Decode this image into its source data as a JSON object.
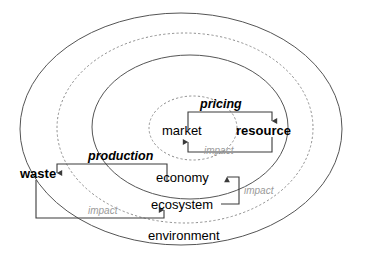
{
  "diagram": {
    "colors": {
      "line": "#555555",
      "dashed": "#8d8d8d",
      "connector": "#3a3a3a",
      "text": "#000000",
      "impact_text": "#9a9a9a",
      "background": "#ffffff"
    },
    "rings": [
      {
        "id": "ring-environment",
        "label": "environment",
        "style": "solid",
        "order": 1
      },
      {
        "id": "ring-dashed-outer",
        "label": "",
        "style": "dashed",
        "order": 2
      },
      {
        "id": "ring-ecosystem-economy",
        "label": "",
        "style": "solid",
        "order": 3
      },
      {
        "id": "ring-dashed-inner",
        "label": "",
        "style": "dashed",
        "order": 4
      }
    ],
    "nodes": [
      {
        "id": "market",
        "label": "market",
        "weight": "regular"
      },
      {
        "id": "resource",
        "label": "resource",
        "weight": "bold"
      },
      {
        "id": "economy",
        "label": "economy",
        "weight": "regular"
      },
      {
        "id": "ecosystem",
        "label": "ecosystem",
        "weight": "regular"
      },
      {
        "id": "waste",
        "label": "waste",
        "weight": "bold"
      },
      {
        "id": "environment",
        "label": "environment",
        "weight": "regular"
      }
    ],
    "flows": [
      {
        "id": "pricing",
        "label": "pricing",
        "from": "market",
        "to": "resource",
        "style": "bold-italic"
      },
      {
        "id": "production",
        "label": "production",
        "from": "economy",
        "to": "waste",
        "style": "bold-italic"
      },
      {
        "id": "impact-market",
        "label": "impact",
        "from": "resource",
        "to": "market",
        "style": "gray-italic"
      },
      {
        "id": "impact-economy",
        "label": "impact",
        "from": "ecosystem",
        "to": "economy",
        "style": "gray-italic"
      },
      {
        "id": "impact-ecosystem",
        "label": "impact",
        "from": "waste",
        "to": "ecosystem",
        "style": "gray-italic"
      }
    ]
  }
}
